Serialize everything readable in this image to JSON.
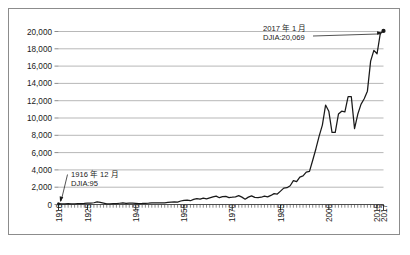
{
  "chart_data": {
    "type": "line",
    "title": "",
    "subtitle": "",
    "xlabel": "",
    "ylabel": "",
    "xlim": [
      1916,
      2017
    ],
    "ylim": [
      0,
      20000
    ],
    "grid": true,
    "legend": "none",
    "y_ticks": [
      0,
      2000,
      4000,
      6000,
      8000,
      10000,
      12000,
      14000,
      16000,
      18000,
      20000
    ],
    "y_tick_labels": [
      "0",
      "2,000",
      "4,000",
      "6,000",
      "8,000",
      "10,000",
      "12,000",
      "14,000",
      "16,000",
      "18,000",
      "20,000"
    ],
    "x_ticks": [
      1916,
      1925,
      1940,
      1955,
      1970,
      1985,
      2000,
      2015,
      2017
    ],
    "x_tick_labels": [
      "1916",
      "1925",
      "1940",
      "1955",
      "1970",
      "1985",
      "2000",
      "2015",
      "2017"
    ],
    "x_minor_tick_interval": 1,
    "series": [
      {
        "name": "DJIA",
        "color": "#1a1a1a",
        "x": [
          1916,
          1917,
          1918,
          1919,
          1920,
          1921,
          1922,
          1923,
          1924,
          1925,
          1926,
          1927,
          1928,
          1929,
          1930,
          1931,
          1932,
          1933,
          1934,
          1935,
          1936,
          1937,
          1938,
          1939,
          1940,
          1941,
          1942,
          1943,
          1944,
          1945,
          1946,
          1947,
          1948,
          1949,
          1950,
          1951,
          1952,
          1953,
          1954,
          1955,
          1956,
          1957,
          1958,
          1959,
          1960,
          1961,
          1962,
          1963,
          1964,
          1965,
          1966,
          1967,
          1968,
          1969,
          1970,
          1971,
          1972,
          1973,
          1974,
          1975,
          1976,
          1977,
          1978,
          1979,
          1980,
          1981,
          1982,
          1983,
          1984,
          1985,
          1986,
          1987,
          1988,
          1989,
          1990,
          1991,
          1992,
          1993,
          1994,
          1995,
          1996,
          1997,
          1998,
          1999,
          2000,
          2001,
          2002,
          2003,
          2004,
          2005,
          2006,
          2007,
          2008,
          2009,
          2010,
          2011,
          2012,
          2013,
          2014,
          2015,
          2016,
          2017
        ],
        "values": [
          95,
          74,
          82,
          107,
          72,
          81,
          99,
          95,
          120,
          156,
          157,
          202,
          300,
          248,
          165,
          77,
          60,
          99,
          104,
          144,
          180,
          121,
          155,
          150,
          131,
          111,
          119,
          136,
          152,
          193,
          177,
          181,
          177,
          200,
          235,
          269,
          292,
          281,
          404,
          488,
          499,
          436,
          584,
          679,
          616,
          731,
          652,
          763,
          874,
          969,
          786,
          905,
          944,
          800,
          839,
          890,
          1020,
          851,
          616,
          852,
          1005,
          831,
          805,
          839,
          964,
          875,
          1047,
          1259,
          1212,
          1547,
          1896,
          1939,
          2169,
          2753,
          2634,
          3169,
          3301,
          3754,
          3834,
          5117,
          6448,
          7908,
          9181,
          11497,
          10788,
          8342,
          8342,
          10454,
          10783,
          10718,
          12463,
          12463,
          8776,
          10428,
          11578,
          12218,
          13104,
          16577,
          17823,
          17425,
          19763,
          20069
        ],
        "start_point": {
          "year": 1916,
          "month": 12,
          "value": 95,
          "label_line1": "1916 年 12 月",
          "label_line2": "DJIA:95"
        },
        "end_point": {
          "year": 2017,
          "month": 1,
          "value": 20069,
          "label_line1": "2017 年 1 月",
          "label_line2": "DJIA:20,069"
        }
      }
    ],
    "annotations": [
      {
        "name": "start-annotation",
        "line1": "1916 年 12 月",
        "line2": "DJIA:95",
        "points_to": {
          "year": 1916,
          "value": 95
        }
      },
      {
        "name": "end-annotation",
        "line1": "2017 年 1 月",
        "line2": "DJIA:20,069",
        "points_to": {
          "year": 2017,
          "value": 20069
        }
      }
    ]
  },
  "caption": {
    "text": ""
  }
}
